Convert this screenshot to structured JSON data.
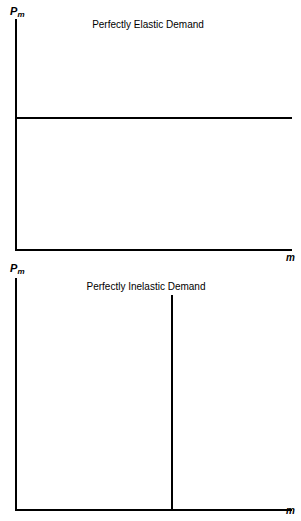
{
  "figures": [
    {
      "id": "elastic",
      "title": "Perfectly Elastic Demand",
      "y_axis_label_main": "P",
      "y_axis_label_sub": "m",
      "x_axis_label": "m"
    },
    {
      "id": "inelastic",
      "title": "Perfectly Inelastic Demand",
      "y_axis_label_main": "P",
      "y_axis_label_sub": "m",
      "x_axis_label": "m"
    }
  ],
  "chart_data": [
    {
      "type": "line",
      "title": "Perfectly Elastic Demand",
      "xlabel": "m",
      "ylabel": "Pm",
      "grid": false,
      "legend": null,
      "axis_ticks": {
        "x": [],
        "y": []
      },
      "xlim": [
        0,
        100
      ],
      "ylim": [
        0,
        100
      ],
      "series": [
        {
          "name": "Perfectly elastic demand curve",
          "x": [
            0,
            100
          ],
          "values": [
            57,
            57
          ],
          "style": "horizontal-line",
          "color": "#000000"
        }
      ],
      "annotations": [
        "Demand curve is horizontal: price fixed, quantity unbounded"
      ]
    },
    {
      "type": "line",
      "title": "Perfectly Inelastic Demand",
      "xlabel": "m",
      "ylabel": "Pm",
      "grid": false,
      "legend": null,
      "axis_ticks": {
        "x": [],
        "y": []
      },
      "xlim": [
        0,
        100
      ],
      "ylim": [
        0,
        100
      ],
      "series": [
        {
          "name": "Perfectly inelastic demand curve",
          "x": [
            56,
            56
          ],
          "values": [
            0,
            93
          ],
          "style": "vertical-line",
          "color": "#000000"
        }
      ],
      "annotations": [
        "Demand curve is vertical: quantity fixed, price unbounded"
      ]
    }
  ],
  "colors": {
    "background": "#ffffff",
    "ink": "#000000"
  }
}
